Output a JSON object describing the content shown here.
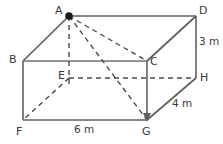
{
  "figure": {
    "type": "rectangular-prism-net",
    "stroke_color": "#555555",
    "dashed_color": "#4a4a4a",
    "label_color": "#3a3a3a",
    "background_color": "#ffffff",
    "marker_vertex": "A"
  },
  "vertices": [
    {
      "name": "A",
      "label": "A",
      "x": 69,
      "y": 16,
      "label_x": 55,
      "label_y": 7,
      "hidden": false,
      "marked": true
    },
    {
      "name": "D",
      "label": "D",
      "x": 196,
      "y": 16,
      "label_x": 199,
      "label_y": 7,
      "hidden": false,
      "marked": false
    },
    {
      "name": "B",
      "label": "B",
      "x": 23,
      "y": 61,
      "label_x": 9,
      "label_y": 55,
      "hidden": false,
      "marked": false
    },
    {
      "name": "C",
      "label": "C",
      "x": 147,
      "y": 61,
      "label_x": 150,
      "label_y": 57,
      "hidden": false,
      "marked": false
    },
    {
      "name": "E",
      "label": "E",
      "x": 69,
      "y": 78,
      "label_x": 58,
      "label_y": 71,
      "hidden": true,
      "marked": false
    },
    {
      "name": "H",
      "label": "H",
      "x": 196,
      "y": 78,
      "label_x": 200,
      "label_y": 73,
      "hidden": false,
      "marked": false
    },
    {
      "name": "F",
      "label": "F",
      "x": 23,
      "y": 120,
      "label_x": 16,
      "label_y": 126,
      "hidden": false,
      "marked": false
    },
    {
      "name": "G",
      "label": "G",
      "x": 147,
      "y": 120,
      "label_x": 142,
      "label_y": 126,
      "hidden": false,
      "marked": false
    }
  ],
  "solid_edges": [
    {
      "name": "edge-A-D",
      "from": "A",
      "to": "D"
    },
    {
      "name": "edge-A-B",
      "from": "A",
      "to": "B"
    },
    {
      "name": "edge-B-C",
      "from": "B",
      "to": "C"
    },
    {
      "name": "edge-C-D",
      "from": "C",
      "to": "D"
    },
    {
      "name": "edge-D-H",
      "from": "D",
      "to": "H"
    },
    {
      "name": "edge-C-G",
      "from": "C",
      "to": "G"
    },
    {
      "name": "edge-B-F",
      "from": "B",
      "to": "F"
    },
    {
      "name": "edge-F-G",
      "from": "F",
      "to": "G"
    },
    {
      "name": "edge-G-H",
      "from": "G",
      "to": "H"
    }
  ],
  "dashed_edges": [
    {
      "name": "edge-E-F",
      "from": "E",
      "to": "F"
    },
    {
      "name": "edge-E-H",
      "from": "E",
      "to": "H"
    },
    {
      "name": "diagonal-A-E",
      "from": "A",
      "to": "E"
    },
    {
      "name": "diagonal-A-G",
      "from": "A",
      "to": "G"
    },
    {
      "name": "diagonal-A-C",
      "from": "A",
      "to": "C"
    }
  ],
  "dimensions": [
    {
      "name": "height-label",
      "text": "3 m",
      "x": 199,
      "y": 38,
      "edge": "D-H"
    },
    {
      "name": "depth-label",
      "text": "4 m",
      "x": 172,
      "y": 99,
      "edge": "G-H"
    },
    {
      "name": "width-label",
      "text": "6 m",
      "x": 74,
      "y": 124,
      "edge": "F-G"
    }
  ],
  "arrowheads": [
    {
      "name": "arrowhead-at-G",
      "x": 147,
      "y": 120,
      "direction": "down"
    }
  ]
}
